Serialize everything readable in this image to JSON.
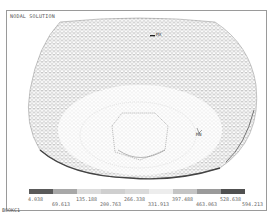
{
  "plot": {
    "title": "NODAL SOLUTION",
    "jobname": "BOOKC1",
    "max_marker": "MX",
    "min_marker": "MN"
  },
  "legend": {
    "segments": [
      "#5a5a5a",
      "#a8a8a8",
      "#dcdcdc",
      "#cfcfcf",
      "#dadada",
      "#ededed",
      "#c4c4c4",
      "#9a9a9a",
      "#505050"
    ],
    "ticks_upper": [
      "4.038",
      "135.188",
      "266.338",
      "397.488",
      "528.638"
    ],
    "ticks_lower": [
      "69.613",
      "200.763",
      "331.913",
      "463.063",
      "594.213"
    ]
  }
}
